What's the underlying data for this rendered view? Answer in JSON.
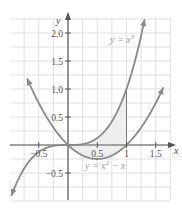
{
  "chart_data": {
    "type": "line",
    "title": "",
    "xlabel": "x",
    "ylabel": "y",
    "xlim": [
      -0.75,
      1.75
    ],
    "ylim": [
      -1.0,
      2.25
    ],
    "grid": true,
    "grid_step": 0.25,
    "x_ticks": [
      {
        "value": -0.5,
        "label": "−0.5"
      },
      {
        "value": 0.5,
        "label": "0.5"
      },
      {
        "value": 1,
        "label": "1"
      },
      {
        "value": 1.5,
        "label": "1.5"
      }
    ],
    "y_ticks": [
      {
        "value": -0.5,
        "label": "−0.5"
      },
      {
        "value": 0.5,
        "label": "0.5"
      },
      {
        "value": 1.0,
        "label": "1.0"
      },
      {
        "value": 1.5,
        "label": "1.5"
      },
      {
        "value": 2.0,
        "label": "2.0"
      }
    ],
    "series": [
      {
        "name": "y = x^3",
        "label": "y = x",
        "label_sup": "3",
        "expression": "x^3",
        "domain": [
          -0.97,
          1.31
        ]
      },
      {
        "name": "y = x^2 - x",
        "label": "y = x",
        "label_sup": "2",
        "label_tail": " − x",
        "expression": "x^2 - x",
        "domain": [
          -0.7,
          1.63
        ]
      }
    ],
    "shaded_region": {
      "between": [
        "y = x^3",
        "y = x^2 - x"
      ],
      "x_range": [
        0,
        1
      ]
    },
    "vertical_segment": {
      "x": 1,
      "y_range": [
        0,
        1
      ]
    },
    "colors": {
      "curve": "#8a8a8a",
      "axis": "#555555",
      "grid": "#d9d9d9",
      "shade": "#eeeeee"
    }
  }
}
